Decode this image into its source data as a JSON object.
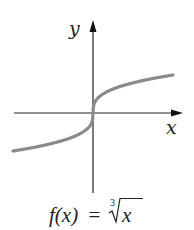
{
  "chart_data": {
    "type": "line",
    "title": "",
    "caption": {
      "lhs": "f(x)",
      "equals": "=",
      "root_index": "3",
      "radicand": "x"
    },
    "xlabel": "x",
    "ylabel": "y",
    "function": "cube root",
    "series": [
      {
        "name": "f(x) = cbrt(x)",
        "x": [
          -8,
          -6,
          -4,
          -2,
          -1,
          -0.5,
          -0.1,
          0,
          0.1,
          0.5,
          1,
          2,
          4,
          6,
          8
        ],
        "y": [
          -2,
          -1.817,
          -1.587,
          -1.26,
          -1,
          -0.794,
          -0.464,
          0,
          0.464,
          0.794,
          1,
          1.26,
          1.587,
          1.817,
          2
        ]
      }
    ],
    "xlim": [
      -8,
      9
    ],
    "ylim": [
      -4,
      4.9
    ],
    "grid": false,
    "legend": false,
    "ticks": "none",
    "colors": {
      "curve": "#8a8a8a",
      "axes": "#222222"
    }
  }
}
